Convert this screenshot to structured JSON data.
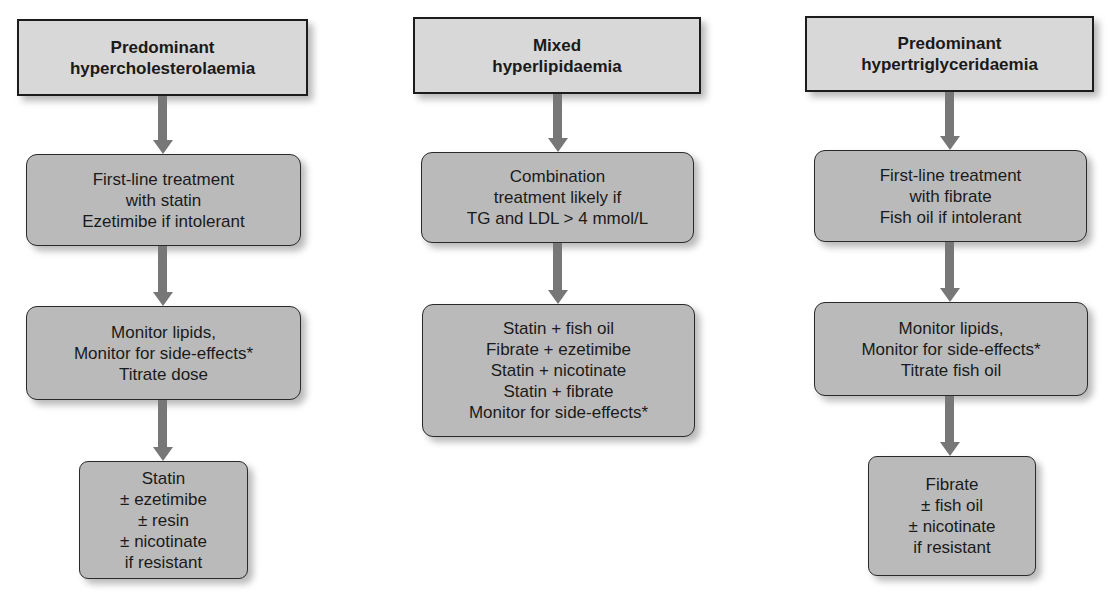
{
  "columns": [
    {
      "header": [
        "Predominant",
        "hypercholesterolaemia"
      ],
      "boxes": [
        [
          "First-line treatment",
          "with statin",
          "Ezetimibe if intolerant"
        ],
        [
          "Monitor lipids,",
          "Monitor for side-effects*",
          "Titrate dose"
        ],
        [
          "Statin",
          "± ezetimibe",
          "± resin",
          "± nicotinate",
          "if resistant"
        ]
      ]
    },
    {
      "header": [
        "Mixed",
        "hyperlipidaemia"
      ],
      "boxes": [
        [
          "Combination",
          "treatment likely if",
          "TG and LDL > 4 mmol/L"
        ],
        [
          "Statin + fish oil",
          "Fibrate + ezetimibe",
          "Statin + nicotinate",
          "Statin + fibrate",
          "Monitor for side-effects*"
        ]
      ]
    },
    {
      "header": [
        "Predominant",
        "hypertriglyceridaemia"
      ],
      "boxes": [
        [
          "First-line treatment",
          "with fibrate",
          "Fish oil if intolerant"
        ],
        [
          "Monitor lipids,",
          "Monitor for side-effects*",
          "Titrate fish oil"
        ],
        [
          "Fibrate",
          "± fish oil",
          "± nicotinate",
          "if resistant"
        ]
      ]
    }
  ],
  "colors": {
    "header_fill": "#d8d8d8",
    "box_fill": "#bababa",
    "arrow": "#777777",
    "border": "#1c1c1c"
  }
}
